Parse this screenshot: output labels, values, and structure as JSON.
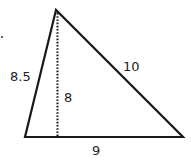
{
  "diagram": {
    "type": "triangle-with-altitude",
    "colors": {
      "stroke": "#1a1a1a",
      "label": "#222222",
      "background": "#ffffff"
    },
    "vertices": {
      "apex": [
        56,
        10
      ],
      "bottom_left": [
        25,
        137
      ],
      "bottom_right": [
        183,
        137
      ]
    },
    "altitude": {
      "from": [
        57,
        12
      ],
      "to": [
        57,
        137
      ],
      "style": "dotted"
    },
    "labels": {
      "left_side": "8.5",
      "right_side": "10",
      "altitude": "8",
      "base": "9"
    },
    "stray_mark": [
      2,
      37
    ]
  }
}
